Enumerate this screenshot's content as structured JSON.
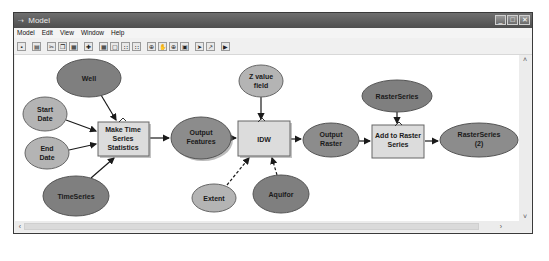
{
  "window": {
    "title": "Model",
    "title_icon": "model-icon",
    "controls": {
      "minimize": "_",
      "maximize": "□",
      "close": "✕"
    }
  },
  "menubar": {
    "items": [
      "Model",
      "Edit",
      "View",
      "Window",
      "Help"
    ]
  },
  "toolbar": {
    "buttons": [
      {
        "name": "save",
        "glyph": "▪"
      },
      {
        "name": "print",
        "glyph": "▤"
      },
      {
        "name": "cut",
        "glyph": "✂"
      },
      {
        "name": "copy",
        "glyph": "❐"
      },
      {
        "name": "paste",
        "glyph": "▦"
      },
      {
        "name": "add-data",
        "glyph": "✚"
      },
      {
        "name": "auto-layout",
        "glyph": "▦"
      },
      {
        "name": "full-extent",
        "glyph": "▢"
      },
      {
        "name": "grid1",
        "glyph": "∷"
      },
      {
        "name": "grid2",
        "glyph": "∷"
      },
      {
        "name": "zoom-in",
        "glyph": "⊕"
      },
      {
        "name": "pan",
        "glyph": "✋"
      },
      {
        "name": "zoom-fixed",
        "glyph": "⊕"
      },
      {
        "name": "overview",
        "glyph": "▣"
      },
      {
        "name": "select",
        "glyph": "➤"
      },
      {
        "name": "connect",
        "glyph": "↗"
      },
      {
        "name": "run",
        "glyph": "▶"
      }
    ]
  },
  "diagram": {
    "colors": {
      "dark_ellipse": "#7f7f7f",
      "light_ellipse": "#b4b4b4",
      "tool_box": "#dcdcdc",
      "edge": "#1a1a1a"
    },
    "nodes": {
      "well": {
        "label": [
          "Well"
        ],
        "type": "variable-dark"
      },
      "start_date": {
        "label": [
          "Start",
          "Date"
        ],
        "type": "variable-light"
      },
      "end_date": {
        "label": [
          "End",
          "Date"
        ],
        "type": "variable-light"
      },
      "timeseries": {
        "label": [
          "TimeSeries"
        ],
        "type": "variable-dark"
      },
      "make_ts_stats": {
        "label": [
          "Make Time",
          "Series",
          "Statistics"
        ],
        "type": "tool"
      },
      "output_features": {
        "label": [
          "Output",
          "Features"
        ],
        "type": "output"
      },
      "z_value_field": {
        "label": [
          "Z value",
          "field"
        ],
        "type": "variable-light"
      },
      "idw": {
        "label": [
          "IDW"
        ],
        "type": "tool"
      },
      "extent": {
        "label": [
          "Extent"
        ],
        "type": "variable-light"
      },
      "aquifor": {
        "label": [
          "Aquifor"
        ],
        "type": "variable-dark"
      },
      "output_raster": {
        "label": [
          "Output",
          "Raster"
        ],
        "type": "output"
      },
      "raster_series": {
        "label": [
          "RasterSeries"
        ],
        "type": "variable-dark"
      },
      "add_to_raster_series": {
        "label": [
          "Add to Raster",
          "Series"
        ],
        "type": "tool"
      },
      "raster_series_2": {
        "label": [
          "RasterSeries",
          "(2)"
        ],
        "type": "output"
      }
    }
  },
  "scrollbars": {
    "up": "˄",
    "down": "˅",
    "left": "‹",
    "right": "›"
  }
}
